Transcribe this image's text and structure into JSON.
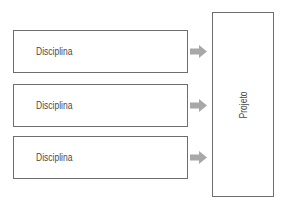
{
  "diagram": {
    "inputs": [
      {
        "label": "Disciplina"
      },
      {
        "label": "Disciplina"
      },
      {
        "label": "Disciplina"
      }
    ],
    "target": {
      "label": "Projeto"
    },
    "arrow_icon": "right-arrow-icon",
    "colors": {
      "border": "#6e6e6e",
      "arrow": "#a8a8a8",
      "text": "#4a4a4a"
    }
  }
}
